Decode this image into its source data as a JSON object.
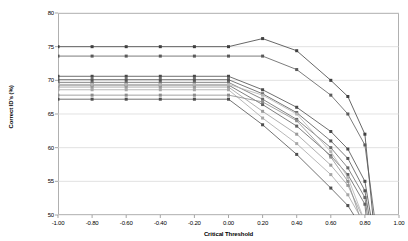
{
  "chart_data": {
    "type": "line",
    "title": "",
    "xlabel": "Critical Threshold",
    "ylabel": "Correct ID's (%)",
    "xlim": [
      -1.0,
      1.0
    ],
    "ylim": [
      50,
      80
    ],
    "xticks": [
      -1.0,
      -0.8,
      -0.6,
      -0.4,
      -0.2,
      0.0,
      0.2,
      0.4,
      0.6,
      0.8,
      1.0
    ],
    "xtick_labels": [
      "-1.00",
      "-0.80",
      "-0.60",
      "-0.40",
      "-0.20",
      "0.00",
      "0.20",
      "0.40",
      "0.60",
      "0.80",
      "1.00"
    ],
    "yticks": [
      50,
      55,
      60,
      65,
      70,
      75,
      80
    ],
    "ytick_labels": [
      "50",
      "55",
      "60",
      "65",
      "70",
      "75",
      "80"
    ],
    "grid": true,
    "grid_axis": "y",
    "legend": false,
    "marker": "square",
    "series": [
      {
        "name": "series-1",
        "color": "#404040",
        "x": [
          -1.0,
          -0.8,
          -0.6,
          -0.4,
          -0.2,
          0.0,
          0.2,
          0.4,
          0.6,
          0.7,
          0.8,
          0.85
        ],
        "values": [
          75.0,
          75.0,
          75.0,
          75.0,
          75.0,
          75.0,
          76.2,
          74.4,
          70.0,
          67.6,
          62.0,
          49.0
        ]
      },
      {
        "name": "series-2",
        "color": "#5a5a5a",
        "x": [
          -1.0,
          -0.8,
          -0.6,
          -0.4,
          -0.2,
          0.0,
          0.2,
          0.4,
          0.6,
          0.7,
          0.8,
          0.86
        ],
        "values": [
          73.6,
          73.6,
          73.6,
          73.6,
          73.6,
          73.6,
          73.6,
          71.6,
          67.8,
          65.0,
          60.4,
          49.0
        ]
      },
      {
        "name": "series-3",
        "color": "#4a4a4a",
        "x": [
          -1.0,
          -0.8,
          -0.6,
          -0.4,
          -0.2,
          0.0,
          0.2,
          0.4,
          0.6,
          0.7,
          0.8,
          0.84
        ],
        "values": [
          70.6,
          70.6,
          70.6,
          70.6,
          70.6,
          70.6,
          68.6,
          66.0,
          62.4,
          59.8,
          55.0,
          49.0
        ]
      },
      {
        "name": "series-4",
        "color": "#555555",
        "x": [
          -1.0,
          -0.8,
          -0.6,
          -0.4,
          -0.2,
          0.0,
          0.2,
          0.4,
          0.6,
          0.7,
          0.8,
          0.83
        ],
        "values": [
          70.1,
          70.1,
          70.1,
          70.1,
          70.1,
          70.1,
          68.0,
          65.2,
          61.0,
          58.4,
          53.6,
          49.0
        ]
      },
      {
        "name": "series-5",
        "color": "#686868",
        "x": [
          -1.0,
          -0.8,
          -0.6,
          -0.4,
          -0.2,
          0.0,
          0.2,
          0.4,
          0.6,
          0.7,
          0.8,
          0.82
        ],
        "values": [
          69.7,
          69.7,
          69.7,
          69.7,
          69.7,
          69.7,
          67.2,
          64.2,
          60.0,
          57.0,
          52.6,
          49.0
        ]
      },
      {
        "name": "series-6",
        "color": "#606060",
        "x": [
          -1.0,
          -0.8,
          -0.6,
          -0.4,
          -0.2,
          0.0,
          0.2,
          0.4,
          0.6,
          0.7,
          0.8,
          0.81
        ],
        "values": [
          69.3,
          69.3,
          69.3,
          69.3,
          69.3,
          69.3,
          66.4,
          63.2,
          58.8,
          56.0,
          51.6,
          49.0
        ]
      },
      {
        "name": "series-7",
        "color": "#9a9a9a",
        "x": [
          -1.0,
          -0.8,
          -0.6,
          -0.4,
          -0.2,
          0.0,
          0.2,
          0.4,
          0.6,
          0.7,
          0.8
        ],
        "values": [
          69.0,
          69.0,
          69.0,
          69.0,
          69.0,
          69.0,
          65.4,
          62.0,
          57.4,
          54.4,
          49.0
        ]
      },
      {
        "name": "series-8",
        "color": "#a6a6a6",
        "x": [
          -1.0,
          -0.8,
          -0.6,
          -0.4,
          -0.2,
          0.0,
          0.2,
          0.4,
          0.6,
          0.7,
          0.79
        ],
        "values": [
          68.6,
          68.6,
          68.6,
          68.6,
          68.6,
          68.6,
          64.4,
          60.6,
          56.0,
          53.0,
          49.0
        ]
      },
      {
        "name": "series-9",
        "color": "#8c8c8c",
        "x": [
          -1.0,
          -0.8,
          -0.6,
          -0.4,
          -0.2,
          0.0,
          0.2,
          0.4,
          0.6,
          0.7,
          0.78
        ],
        "values": [
          67.8,
          67.8,
          67.8,
          67.8,
          67.8,
          67.8,
          66.8,
          64.0,
          58.6,
          55.0,
          49.0
        ]
      },
      {
        "name": "series-10",
        "color": "#4f4f4f",
        "x": [
          -1.0,
          -0.8,
          -0.6,
          -0.4,
          -0.2,
          0.0,
          0.2,
          0.4,
          0.6,
          0.7,
          0.76
        ],
        "values": [
          67.2,
          67.2,
          67.2,
          67.2,
          67.2,
          67.2,
          63.4,
          59.0,
          54.0,
          51.4,
          49.0
        ]
      },
      {
        "name": "series-11",
        "color": "#b4b4b4",
        "x": [
          -1.0,
          -0.8,
          -0.6,
          -0.4,
          -0.2,
          0.0,
          0.2,
          0.4,
          0.6,
          0.7,
          0.8
        ],
        "values": [
          69.4,
          69.4,
          69.4,
          69.4,
          69.4,
          69.4,
          67.8,
          65.0,
          59.4,
          55.6,
          49.0
        ]
      }
    ]
  }
}
